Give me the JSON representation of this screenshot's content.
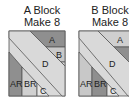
{
  "blocks": [
    {
      "title": "A Block",
      "subtitle": "Make 8",
      "pieces": {
        "a": "A",
        "b": "B",
        "c1": "C",
        "c2": "C",
        "d": "D",
        "ar": "AR",
        "br": "BR"
      }
    },
    {
      "title": "B Block",
      "subtitle": "Make 8",
      "pieces": {
        "a": "A",
        "b": "B",
        "c1": "C",
        "c2": "C",
        "d": "D",
        "ar": "AR",
        "br": "BR"
      }
    }
  ],
  "colors": {
    "dark": "#8f8f8f",
    "medium": "#b5b5b5",
    "light": "#d9d9d9",
    "border": "#555555"
  }
}
